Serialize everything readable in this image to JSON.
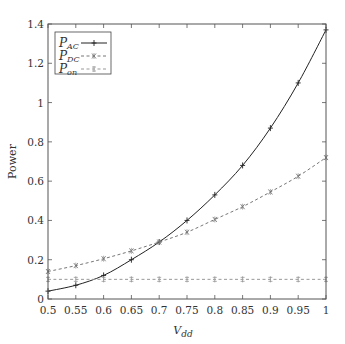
{
  "chart_data": {
    "type": "line",
    "title": "",
    "xlabel": "V",
    "xlabel_sub": "dd",
    "ylabel": "Power",
    "xlim": [
      0.5,
      1
    ],
    "ylim": [
      0,
      1.4
    ],
    "grid": false,
    "legend_position": "upper left",
    "x": [
      0.5,
      0.55,
      0.6,
      0.65,
      0.7,
      0.75,
      0.8,
      0.85,
      0.9,
      0.95,
      1
    ],
    "x_ticks": [
      "0.5",
      "0.55",
      "0.6",
      "0.65",
      "0.7",
      "0.75",
      "0.8",
      "0.85",
      "0.9",
      "0.95",
      "1"
    ],
    "y_ticks": [
      {
        "value": 0,
        "label": "0"
      },
      {
        "value": 0.2,
        "label": "0.2"
      },
      {
        "value": 0.4,
        "label": "0.4"
      },
      {
        "value": 0.6,
        "label": "0.6"
      },
      {
        "value": 0.8,
        "label": "0.8"
      },
      {
        "value": 1.0,
        "label": "1"
      },
      {
        "value": 1.2,
        "label": "1.2"
      },
      {
        "value": 1.4,
        "label": "1.4"
      }
    ],
    "series": [
      {
        "name": "P_AC",
        "label_main": "P",
        "label_sub": "AC",
        "color": "#222222",
        "dash": "",
        "marker": "+",
        "values": [
          0.04,
          0.07,
          0.12,
          0.2,
          0.29,
          0.4,
          0.53,
          0.68,
          0.87,
          1.1,
          1.37
        ]
      },
      {
        "name": "P_DC",
        "label_main": "P",
        "label_sub": "DC",
        "color": "#777777",
        "dash": "3,2.5",
        "marker": "x",
        "values": [
          0.14,
          0.17,
          0.205,
          0.245,
          0.29,
          0.34,
          0.405,
          0.47,
          0.545,
          0.625,
          0.72
        ]
      },
      {
        "name": "P_on",
        "label_main": "P",
        "label_sub": "on",
        "color": "#999999",
        "dash": "3,2.5",
        "marker": "*",
        "values": [
          0.1,
          0.1,
          0.1,
          0.1,
          0.1,
          0.1,
          0.1,
          0.1,
          0.1,
          0.1,
          0.1
        ]
      }
    ]
  }
}
